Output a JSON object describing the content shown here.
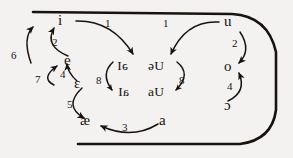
{
  "diagram": {
    "type": "ipa-vowel-quadrilateral",
    "background_color": "#f3f2f0",
    "ink_color": "#17140f",
    "outline": {
      "name": "vowel-space-outline",
      "description": "Open-ended vowel trapezoid: straight top line, straight bottom line, rounded right side"
    },
    "vowels": {
      "front": [
        {
          "id": "i",
          "symbol": "i",
          "x": 62,
          "y": 20
        },
        {
          "id": "e",
          "symbol": "e",
          "x": 69,
          "y": 60
        },
        {
          "id": "open-e",
          "symbol": "ɛ",
          "x": 78,
          "y": 83
        },
        {
          "id": "ae",
          "symbol": "æ",
          "x": 85,
          "y": 121
        }
      ],
      "back": [
        {
          "id": "u",
          "symbol": "u",
          "x": 228,
          "y": 22
        },
        {
          "id": "o",
          "symbol": "o",
          "x": 228,
          "y": 66
        },
        {
          "id": "open-o",
          "symbol": "ɔ",
          "x": 228,
          "y": 105
        },
        {
          "id": "a",
          "symbol": "a",
          "x": 163,
          "y": 121
        }
      ]
    },
    "diphthongs": [
      {
        "id": "schwa-i",
        "symbol": "əI",
        "x": 111,
        "y": 66,
        "mirrored": true
      },
      {
        "id": "schwa-u",
        "symbol": "əU",
        "x": 152,
        "y": 66,
        "mirrored": false
      },
      {
        "id": "a-i",
        "symbol": "aI",
        "x": 112,
        "y": 92,
        "mirrored": true
      },
      {
        "id": "a-u",
        "symbol": "aU",
        "x": 152,
        "y": 92,
        "mirrored": false
      }
    ],
    "arrow_labels": [
      {
        "id": "step-1-front",
        "text": "1",
        "x": 108,
        "y": 24
      },
      {
        "id": "step-1-back",
        "text": "1",
        "x": 166,
        "y": 24
      },
      {
        "id": "step-2-front",
        "text": "2",
        "x": 55,
        "y": 43
      },
      {
        "id": "step-2-back",
        "text": "2",
        "x": 235,
        "y": 44
      },
      {
        "id": "step-3",
        "text": "3",
        "x": 125,
        "y": 128
      },
      {
        "id": "step-4-front",
        "text": "4",
        "x": 63,
        "y": 75
      },
      {
        "id": "step-4-back",
        "text": "4",
        "x": 230,
        "y": 87
      },
      {
        "id": "step-5",
        "text": "5",
        "x": 70,
        "y": 105
      },
      {
        "id": "step-6",
        "text": "6",
        "x": 14,
        "y": 56
      },
      {
        "id": "step-7",
        "text": "7",
        "x": 38,
        "y": 80
      },
      {
        "id": "step-8-front",
        "text": "8",
        "x": 99,
        "y": 81
      },
      {
        "id": "step-8-back",
        "text": "8",
        "x": 181,
        "y": 81
      }
    ]
  }
}
